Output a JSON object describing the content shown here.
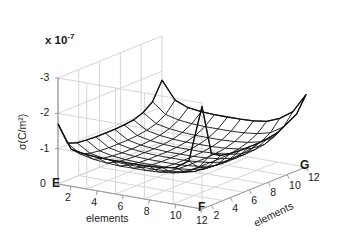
{
  "figure": {
    "type": "matlab-mesh-3d",
    "background": "#ffffff",
    "exponent_label": "x 10",
    "exponent_sup": "-7",
    "ylabel": "σ(C/m²)",
    "corner_e": "E",
    "corner_f": "F",
    "corner_g": "G",
    "left_axis_name": "elements",
    "right_axis_name": "elements",
    "z_ticks": [
      "0",
      "-1",
      "-2",
      "-3"
    ],
    "left_ticks": [
      "2",
      "4",
      "6",
      "8",
      "10",
      "12"
    ],
    "right_ticks": [
      "2",
      "4",
      "6",
      "8",
      "10",
      "12"
    ],
    "mesh_color": "#111111",
    "grid_color": "#d6d6d6",
    "axis_color": "#9a9a9a"
  },
  "chart_data": {
    "type": "line",
    "subtype": "3d-mesh-surface",
    "title": "",
    "xlabel": "elements",
    "ylabel": "elements",
    "zlabel": "σ(C/m²)",
    "z_exponent": -7,
    "zlim": [
      -3,
      0
    ],
    "z_ticks": [
      0,
      -1,
      -2,
      -3
    ],
    "xlim": [
      1,
      12
    ],
    "ylim": [
      1,
      12
    ],
    "x_ticks": [
      2,
      4,
      6,
      8,
      10,
      12
    ],
    "y_ticks": [
      2,
      4,
      6,
      8,
      10,
      12
    ],
    "grid": true,
    "legend": "none",
    "annotations": [
      "E",
      "F",
      "G"
    ],
    "nx": 12,
    "ny": 12,
    "z_values": [
      [
        -1.7,
        -1.05,
        -0.95,
        -0.92,
        -0.9,
        -0.9,
        -0.9,
        -0.92,
        -0.95,
        -1.05,
        -1.25,
        -1.75
      ],
      [
        -1.05,
        -0.8,
        -0.72,
        -0.68,
        -0.66,
        -0.66,
        -0.66,
        -0.68,
        -0.72,
        -0.8,
        -0.95,
        -1.25
      ],
      [
        -0.98,
        -0.72,
        -0.64,
        -0.6,
        -0.58,
        -0.58,
        -0.58,
        -0.6,
        -0.64,
        -0.72,
        -0.86,
        -1.1
      ],
      [
        -0.95,
        -0.68,
        -0.6,
        -0.56,
        -0.54,
        -0.54,
        -0.54,
        -0.56,
        -0.6,
        -0.68,
        -0.82,
        -1.05
      ],
      [
        -0.94,
        -0.66,
        -0.58,
        -0.54,
        -0.52,
        -0.52,
        -0.52,
        -0.54,
        -0.58,
        -0.66,
        -0.8,
        -1.03
      ],
      [
        -0.94,
        -0.66,
        -0.58,
        -0.54,
        -0.52,
        -0.52,
        -0.52,
        -0.54,
        -0.58,
        -0.66,
        -0.8,
        -1.03
      ],
      [
        -0.94,
        -0.66,
        -0.58,
        -0.54,
        -0.52,
        -0.52,
        -0.52,
        -0.54,
        -0.58,
        -0.66,
        -0.8,
        -1.03
      ],
      [
        -0.95,
        -0.68,
        -0.6,
        -0.56,
        -0.54,
        -0.54,
        -0.54,
        -0.56,
        -0.6,
        -0.68,
        -0.82,
        -1.05
      ],
      [
        -0.98,
        -0.72,
        -0.64,
        -0.6,
        -0.58,
        -0.58,
        -0.58,
        -0.6,
        -0.64,
        -0.72,
        -0.86,
        -1.1
      ],
      [
        -1.05,
        -0.8,
        -0.72,
        -0.68,
        -0.66,
        -0.66,
        -0.66,
        -0.68,
        -0.72,
        -0.8,
        -0.95,
        -1.25
      ],
      [
        -1.3,
        -1.0,
        -0.9,
        -0.86,
        -0.84,
        -0.84,
        -0.84,
        -0.86,
        -0.9,
        -1.0,
        -1.18,
        -1.5
      ],
      [
        -2.9,
        -1.45,
        -1.3,
        -1.25,
        -1.22,
        -1.22,
        -1.22,
        -1.25,
        -1.3,
        -1.45,
        -1.6,
        -2.05
      ]
    ]
  }
}
